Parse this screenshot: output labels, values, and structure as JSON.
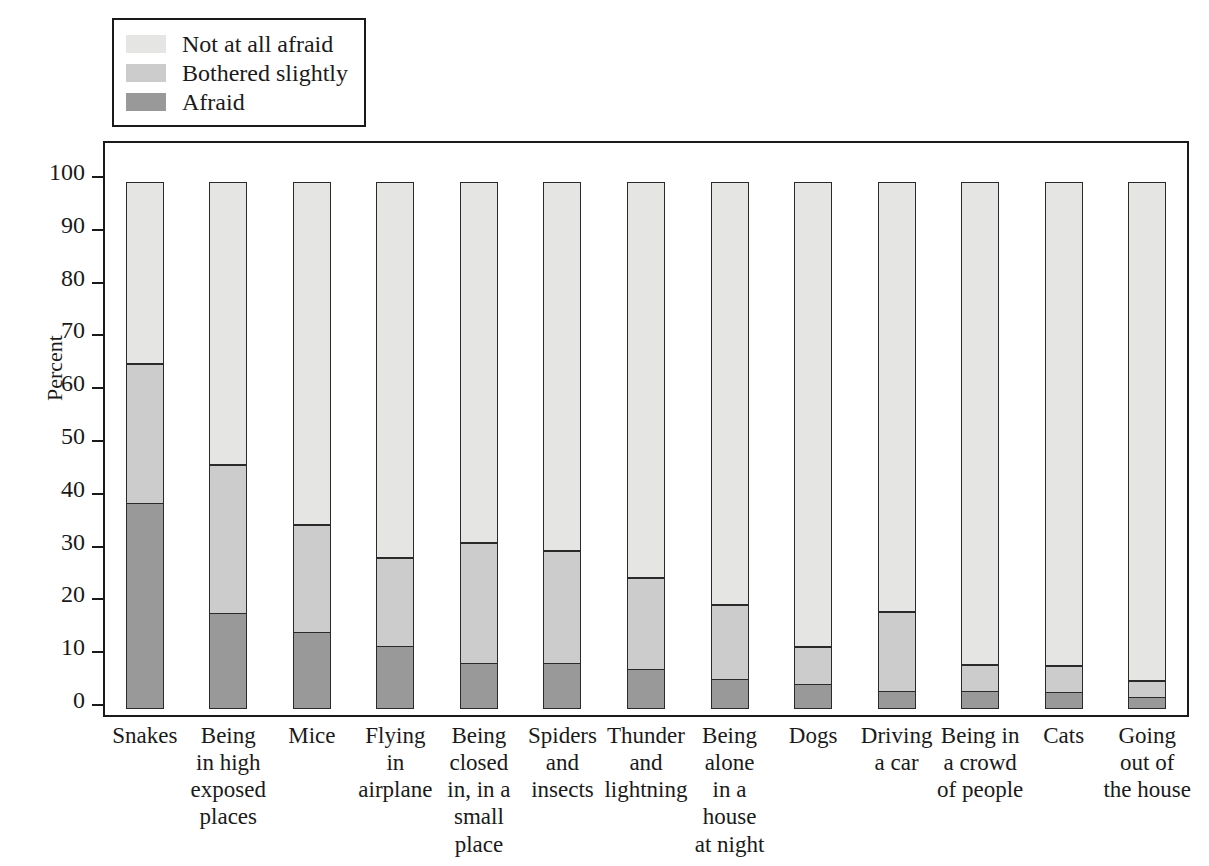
{
  "chart_data": {
    "type": "bar",
    "subtype": "stacked-bar-100",
    "title": "",
    "xlabel": "",
    "ylabel": "Percent",
    "ylim": [
      0,
      100
    ],
    "yticks": [
      0,
      10,
      20,
      30,
      40,
      50,
      60,
      70,
      80,
      90,
      100
    ],
    "grid": false,
    "legend_position": "top-left",
    "categories": [
      "Snakes",
      "Being\nin high\nexposed\nplaces",
      "Mice",
      "Flying\nin\nairplane",
      "Being\nclosed\nin, in a\nsmall\nplace",
      "Spiders\nand\ninsects",
      "Thunder\nand\nlightning",
      "Being\nalone\nin a\nhouse\nat night",
      "Dogs",
      "Driving\na car",
      "Being in\na crowd\nof people",
      "Cats",
      "Going\nout of\nthe house"
    ],
    "series": [
      {
        "name": "Afraid",
        "color": "#999999",
        "values": [
          39.0,
          18.0,
          14.5,
          11.8,
          8.6,
          8.6,
          7.4,
          5.6,
          4.7,
          3.3,
          3.4,
          3.2,
          2.2
        ]
      },
      {
        "name": "Bothered slightly",
        "color": "#cccccc",
        "values": [
          26.5,
          28.5,
          20.5,
          17.0,
          23.0,
          21.6,
          17.6,
          14.3,
          7.2,
          15.3,
          5.1,
          5.2,
          3.3
        ]
      },
      {
        "name": "Not at all afraid",
        "color": "#e5e5e3",
        "values": [
          34.5,
          53.5,
          65.0,
          71.2,
          68.4,
          69.8,
          75.0,
          80.1,
          88.1,
          81.4,
          91.5,
          91.6,
          94.5
        ]
      }
    ],
    "cumulative_tops": {
      "afraid": [
        39.0,
        18.0,
        14.5,
        11.8,
        8.6,
        8.6,
        7.4,
        5.6,
        4.7,
        3.3,
        3.4,
        3.2,
        2.2
      ],
      "afraid_plus_bothered": [
        65.5,
        46.5,
        35.0,
        28.8,
        31.6,
        30.2,
        25.0,
        19.9,
        11.9,
        18.6,
        8.5,
        8.4,
        5.5
      ],
      "total": [
        100,
        100,
        100,
        100,
        100,
        100,
        100,
        100,
        100,
        100,
        100,
        100,
        100
      ]
    }
  },
  "legend": {
    "items": [
      {
        "label": "Not at all afraid",
        "color": "#e5e5e3"
      },
      {
        "label": "Bothered slightly",
        "color": "#cccccc"
      },
      {
        "label": "Afraid",
        "color": "#999999"
      }
    ]
  },
  "axis": {
    "y_title": "Percent",
    "y_tick_labels": [
      "100",
      "90",
      "80",
      "70",
      "60",
      "50",
      "40",
      "30",
      "20",
      "10",
      "0"
    ]
  },
  "colors": {
    "not_at_all_afraid": "#e5e5e3",
    "bothered_slightly": "#cccccc",
    "afraid": "#999999",
    "outline": "#2a2a2a",
    "text": "#1a1a1a",
    "background": "#ffffff"
  }
}
